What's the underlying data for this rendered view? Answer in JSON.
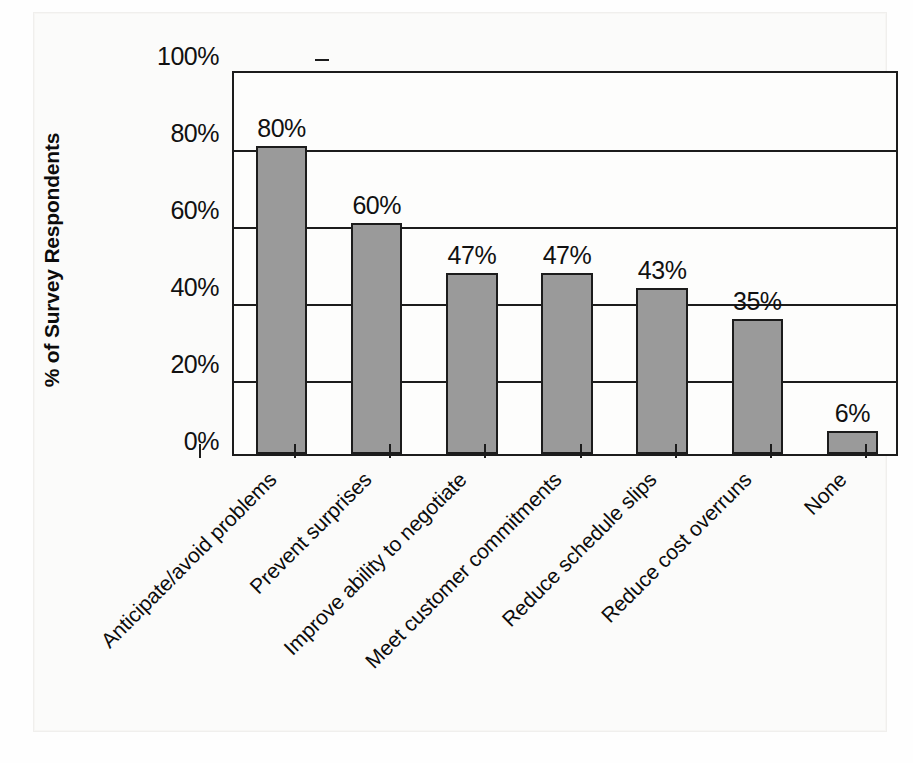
{
  "chart_data": {
    "type": "bar",
    "title": "",
    "xlabel": "",
    "ylabel": "% of Survey Respondents",
    "ylim": [
      0,
      100
    ],
    "ytick_labels": [
      "0%",
      "20%",
      "40%",
      "60%",
      "80%",
      "100%"
    ],
    "ytick_values": [
      0,
      20,
      40,
      60,
      80,
      100
    ],
    "grid": true,
    "legend": "none",
    "categories": [
      "Anticipate/avoid problems",
      "Prevent surprises",
      "Improve ability to negotiate",
      "Meet customer commitments",
      "Reduce schedule slips",
      "Reduce cost overruns",
      "None"
    ],
    "values": [
      80,
      60,
      47,
      47,
      43,
      35,
      6
    ],
    "value_labels": [
      "80%",
      "60%",
      "47%",
      "47%",
      "43%",
      "35%",
      "6%"
    ],
    "colors": {
      "bar_fill": "#9a9a9a",
      "bar_stroke": "#1c1c1c",
      "axis": "#1c1c1c",
      "text": "#111111",
      "plot_background": "#fdfdfc",
      "page_background": "#fbfbfa"
    }
  }
}
